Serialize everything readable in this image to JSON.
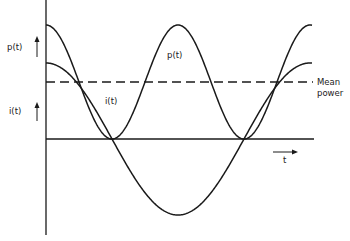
{
  "diagram": {
    "labels": {
      "p_axis": "p(t)",
      "i_axis": "i(t)",
      "p_curve": "p(t)",
      "i_curve": "i(t)",
      "mean_line_1": "Mean",
      "mean_line_2": "power",
      "time_axis": "t"
    },
    "colors": {
      "stroke": "#1a1a1a",
      "background": "#ffffff"
    },
    "geometry": {
      "axis_x": 46,
      "baseline_y": 139,
      "mean_y": 82,
      "curve_start_x": 46,
      "curve_end_x": 312,
      "i_amplitude": 76,
      "p_max_y": 25,
      "p_min_y": 139
    }
  }
}
